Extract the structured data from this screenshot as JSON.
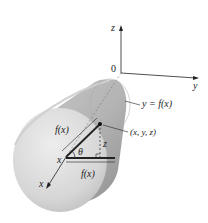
{
  "diagram": {
    "type": "3d-surface-of-revolution",
    "axes": {
      "z_label": "z",
      "y_label": "y",
      "x_label": "x",
      "origin_label": "0"
    },
    "labels": {
      "curve": "y = f(x)",
      "point": "(x, y, z)",
      "radius_slant": "f(x)",
      "radius_horizontal": "f(x)",
      "height": "z",
      "angle": "θ",
      "x_on_axis": "x"
    },
    "colors": {
      "surface_light": "#e4e4e4",
      "surface_mid": "#bdbdbd",
      "surface_dark": "#9a9a9a",
      "line": "#222222"
    }
  }
}
